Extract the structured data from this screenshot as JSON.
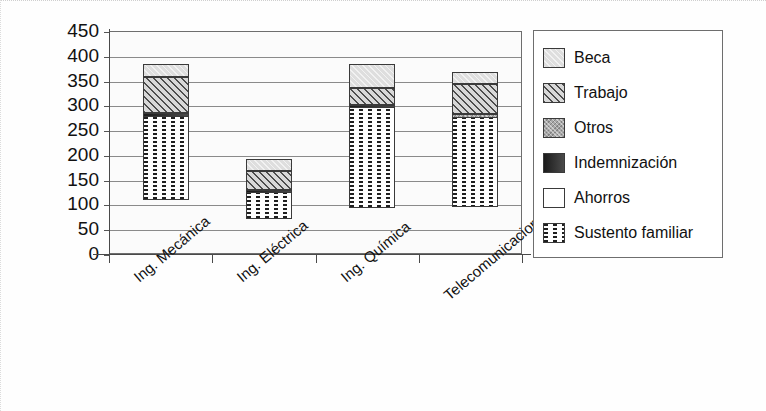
{
  "chart_data": {
    "type": "bar",
    "subtype": "stacked",
    "title": "",
    "xlabel": "",
    "ylabel": "",
    "ylim": [
      0,
      450
    ],
    "ytick_step": 50,
    "yticks": [
      "450",
      "400",
      "350",
      "300",
      "250",
      "200",
      "150",
      "100",
      "50",
      "0"
    ],
    "grid": true,
    "legend_position": "right",
    "categories": [
      "Ing. Mecánica",
      "Ing. Eléctrica",
      "Ing. Química",
      "Telecomunicaciones"
    ],
    "series": [
      {
        "name": "Sustento familiar",
        "pattern": "vertical-dotted",
        "values": [
          275,
          122,
          292,
          272
        ]
      },
      {
        "name": "Ahorros",
        "pattern": "empty",
        "values": [
          0,
          0,
          0,
          0
        ]
      },
      {
        "name": "Indemnización",
        "pattern": "solid-dark",
        "values": [
          8,
          5,
          6,
          0
        ]
      },
      {
        "name": "Otros",
        "pattern": "gray",
        "values": [
          0,
          0,
          0,
          8
        ]
      },
      {
        "name": "Trabajo",
        "pattern": "diagonal-hatch",
        "values": [
          72,
          38,
          35,
          62
        ]
      },
      {
        "name": "Beca",
        "pattern": "light-gray",
        "values": [
          27,
          25,
          49,
          23
        ]
      }
    ],
    "totals": [
      382,
      190,
      382,
      365
    ]
  },
  "legend": {
    "items": [
      {
        "label": "Beca",
        "swatch": "light-gray-swatch"
      },
      {
        "label": "Trabajo",
        "swatch": "diagonal-hatch-swatch"
      },
      {
        "label": "Otros",
        "swatch": "gray-swatch"
      },
      {
        "label": "Indemnización",
        "swatch": "solid-dark-swatch"
      },
      {
        "label": "Ahorros",
        "swatch": "empty-swatch"
      },
      {
        "label": "Sustento familiar",
        "swatch": "vertical-dotted-swatch"
      }
    ]
  },
  "colors": {
    "axis": "#4a4a4a",
    "gridline": "#8a8a8a",
    "plot_background": "#fbfbfb",
    "beca": "#dedede",
    "trabajo": "#d8d8d8",
    "otros": "#a8a8a8",
    "indemnizacion": "#2a2a2a",
    "ahorros": "#ffffff",
    "sustento_familiar": "#fdfdfd"
  }
}
